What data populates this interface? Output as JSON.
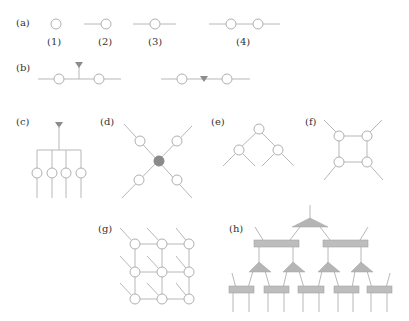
{
  "figure": {
    "panels": [
      {
        "id": "a",
        "label": "(a)",
        "sublabels": [
          "(1)",
          "(2)",
          "(3)",
          "(4)"
        ],
        "description": "Scalar, vector, matrix, and two-node tensor diagrams"
      },
      {
        "id": "b",
        "label": "(b)",
        "description": "Contraction with an inserted dual vector / triangle node"
      },
      {
        "id": "c",
        "label": "(c)",
        "description": "Four nodes with open legs joined to a common triangle"
      },
      {
        "id": "d",
        "label": "(d)",
        "description": "Star of four nodes around a filled central node"
      },
      {
        "id": "e",
        "label": "(e)",
        "description": "Tree network"
      },
      {
        "id": "f",
        "label": "(f)",
        "description": "Four-node ring with open legs"
      },
      {
        "id": "g",
        "label": "(g)",
        "description": "3x3 PEPS-like grid with diagonal physical legs"
      },
      {
        "id": "h",
        "label": "(h)",
        "description": "MERA-like hierarchical network with triangles and rectangles"
      }
    ],
    "colors": {
      "line": "#b8b8b8",
      "node_stroke": "#b0b0b0",
      "dark_node": "#8a8a8a",
      "triangle": "#8c8c8c",
      "rect_fill": "#bdbdbd",
      "text": "#333333"
    }
  }
}
